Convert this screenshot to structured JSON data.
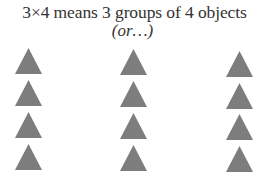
{
  "header": {
    "title": "3×4 means 3 groups of 4 objects",
    "subtitle": "(or…)"
  },
  "diagram": {
    "groups": 3,
    "objects_per_group": 4,
    "object_shape": "triangle",
    "object_color": "#7d7d7d",
    "columns": [
      {
        "x": 15,
        "tops": [
          48,
          80,
          112,
          144
        ]
      },
      {
        "x": 120,
        "tops": [
          49,
          81,
          113,
          145
        ]
      },
      {
        "x": 226,
        "tops": [
          51,
          83,
          114,
          146
        ]
      }
    ]
  }
}
